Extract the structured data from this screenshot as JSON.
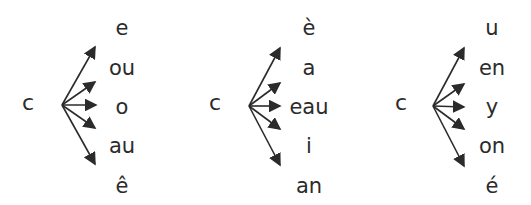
{
  "diagram": {
    "type": "syllable-combination-fans",
    "arrow_color": "#2b2b2b",
    "groups": [
      {
        "consonant": "c",
        "vowels": [
          "e",
          "ou",
          "o",
          "au",
          "ê"
        ]
      },
      {
        "consonant": "c",
        "vowels": [
          "è",
          "a",
          "eau",
          "i",
          "an"
        ]
      },
      {
        "consonant": "c",
        "vowels": [
          "u",
          "en",
          "y",
          "on",
          "é"
        ]
      }
    ]
  }
}
